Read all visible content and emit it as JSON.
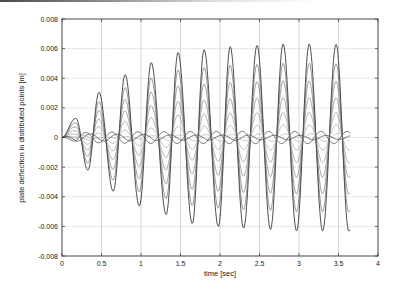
{
  "chart_data": {
    "type": "line",
    "title": "",
    "xlabel": "time [sec]",
    "ylabel": "plate deflection in distributed points [m]",
    "xlim": [
      0,
      4
    ],
    "ylim": [
      -0.008,
      0.008
    ],
    "xticks": [
      "0",
      "0.5",
      "1",
      "1.5",
      "2",
      "2.5",
      "3",
      "3.5",
      "4"
    ],
    "yticks": [
      "0.008",
      "0.006",
      "0.004",
      "0.002",
      "0",
      "-0.002",
      "-0.004",
      "-0.006",
      "-0.008"
    ],
    "grid": true,
    "legend": "none",
    "data_end_time": 3.65,
    "series": [
      {
        "name": "outer point (max deflection) envelope",
        "positive_peaks": [
          [
            0.18,
            0.0013
          ],
          [
            0.47,
            0.003
          ],
          [
            0.8,
            0.0042
          ],
          [
            1.13,
            0.005
          ],
          [
            1.47,
            0.0057
          ],
          [
            1.8,
            0.0059
          ],
          [
            2.13,
            0.0061
          ],
          [
            2.47,
            0.0062
          ],
          [
            2.8,
            0.0063
          ],
          [
            3.13,
            0.0063
          ],
          [
            3.47,
            0.0063
          ]
        ],
        "negative_peaks": [
          [
            0.33,
            -0.0022
          ],
          [
            0.65,
            -0.0036
          ],
          [
            0.98,
            -0.0046
          ],
          [
            1.32,
            -0.0052
          ],
          [
            1.65,
            -0.0058
          ],
          [
            1.98,
            -0.006
          ],
          [
            2.3,
            -0.0061
          ],
          [
            2.64,
            -0.0062
          ],
          [
            2.97,
            -0.0063
          ],
          [
            3.3,
            -0.0063
          ],
          [
            3.63,
            -0.0063
          ]
        ]
      },
      {
        "name": "point 2",
        "scale": 0.8
      },
      {
        "name": "point 3",
        "scale": 0.62
      },
      {
        "name": "point 4",
        "scale": 0.45
      },
      {
        "name": "point 5",
        "scale": 0.3
      },
      {
        "name": "point 6",
        "scale": 0.17
      },
      {
        "name": "point 7",
        "scale": 0.07
      }
    ]
  }
}
